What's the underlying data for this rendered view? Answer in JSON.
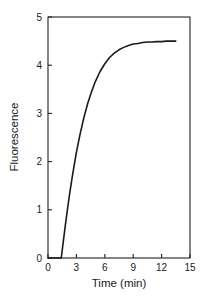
{
  "chart_data": {
    "type": "line",
    "title": "",
    "xlabel": "Time (min)",
    "ylabel": "Fluorescence",
    "xlim": [
      0,
      15
    ],
    "ylim": [
      0,
      5
    ],
    "xticks": [
      0,
      3,
      6,
      9,
      12,
      15
    ],
    "yticks": [
      0,
      1,
      2,
      3,
      4,
      5
    ],
    "xtick_labels": [
      "0",
      "3",
      "6",
      "9",
      "12",
      "15"
    ],
    "ytick_labels": [
      "0",
      "1",
      "2",
      "3",
      "4",
      "5"
    ],
    "grid": false,
    "legend": "none",
    "series": [
      {
        "name": "Fluorescence kinetics",
        "color": "#1a1a1a",
        "lag_time_min": 1.4,
        "plateau": 4.5,
        "x": [
          0.0,
          0.3,
          0.6,
          0.9,
          1.2,
          1.4,
          1.6,
          1.8,
          2.0,
          2.3,
          2.6,
          3.0,
          3.4,
          3.8,
          4.2,
          4.6,
          5.0,
          5.5,
          6.0,
          6.5,
          7.0,
          7.5,
          8.0,
          8.5,
          9.0,
          9.5,
          10.0,
          10.5,
          11.0,
          11.5,
          12.0,
          12.5,
          13.0,
          13.5
        ],
        "y": [
          0.0,
          0.0,
          0.0,
          0.0,
          0.0,
          0.0,
          0.32,
          0.63,
          0.93,
          1.35,
          1.73,
          2.19,
          2.58,
          2.92,
          3.21,
          3.45,
          3.66,
          3.87,
          4.03,
          4.16,
          4.25,
          4.32,
          4.37,
          4.41,
          4.44,
          4.45,
          4.47,
          4.48,
          4.48,
          4.49,
          4.49,
          4.5,
          4.5,
          4.5
        ]
      }
    ]
  },
  "axes": {
    "x_title": "Time (min)",
    "y_title": "Fluorescence"
  }
}
